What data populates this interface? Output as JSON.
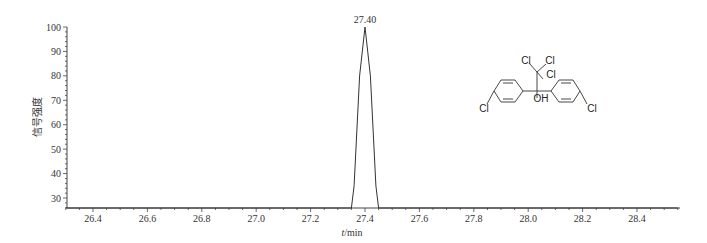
{
  "chart_data": {
    "type": "line",
    "title": "",
    "xlabel": "t/min",
    "ylabel": "信号强度",
    "xlim": [
      26.3,
      28.55
    ],
    "ylim": [
      25.9,
      100
    ],
    "x_ticks": [
      "26.4",
      "26.6",
      "26.8",
      "27.0",
      "27.2",
      "27.4",
      "27.6",
      "27.8",
      "28.0",
      "28.2",
      "28.4"
    ],
    "y_ticks": [
      "30",
      "40",
      "50",
      "60",
      "70",
      "80",
      "90",
      "100"
    ],
    "grid": false,
    "legend": null,
    "series": [
      {
        "name": "chromatogram",
        "x": [
          26.3,
          27.35,
          27.36,
          27.38,
          27.4,
          27.42,
          27.44,
          27.45,
          28.55
        ],
        "y": [
          25.9,
          25.9,
          35,
          80,
          100,
          80,
          35,
          25.9,
          25.9
        ]
      }
    ],
    "annotations": [
      {
        "text": "27.40",
        "x": 27.4,
        "y": 100,
        "type": "peak-label"
      }
    ],
    "inset_structure": {
      "labels": [
        "Cl",
        "Cl",
        "Cl",
        "OH",
        "Cl",
        "Cl"
      ],
      "description": "2,2,2-trichloro-1,1-bis(4-chlorophenyl)ethanol"
    }
  }
}
